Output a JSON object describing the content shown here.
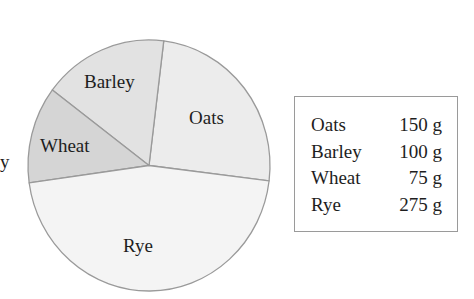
{
  "chart_data": {
    "type": "pie",
    "title": "",
    "categories": [
      "Oats",
      "Barley",
      "Wheat",
      "Rye"
    ],
    "values": [
      150,
      100,
      75,
      275
    ],
    "unit": "g",
    "total": 600,
    "slices": [
      {
        "label": "Oats",
        "value": 150,
        "display": "150 g",
        "color": "#ececec",
        "start_deg": 7,
        "end_deg": 97
      },
      {
        "label": "Barley",
        "value": 100,
        "display": "100 g",
        "color": "#e2e2e2",
        "start_deg": 307,
        "end_deg": 367
      },
      {
        "label": "Wheat",
        "value": 75,
        "display": "75 g",
        "color": "#d5d5d5",
        "start_deg": 262,
        "end_deg": 307
      },
      {
        "label": "Rye",
        "value": 275,
        "display": "275 g",
        "color": "#f4f4f4",
        "start_deg": 97,
        "end_deg": 262
      }
    ],
    "legend": {
      "position": "right",
      "entries": [
        {
          "name": "Oats",
          "value": "150 g"
        },
        {
          "name": "Barley",
          "value": "100 g"
        },
        {
          "name": "Wheat",
          "value": "75 g"
        },
        {
          "name": "Rye",
          "value": "275 g"
        }
      ]
    }
  },
  "pie": {
    "labels": {
      "oats": "Oats",
      "barley": "Barley",
      "wheat": "Wheat",
      "rye": "Rye"
    }
  },
  "edge_fragment": "y",
  "colors": {
    "border": "#9a9a9a",
    "text": "#1e1e1e"
  }
}
